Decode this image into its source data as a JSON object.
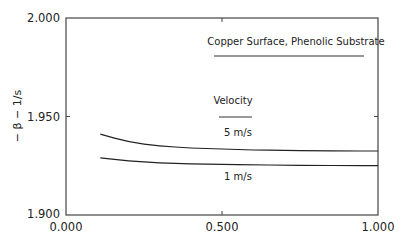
{
  "chart_data": {
    "type": "line",
    "title": "",
    "xlabel": "",
    "ylabel": "− β − 1/s",
    "xlim": [
      0.0,
      1.0
    ],
    "ylim": [
      1.9,
      2.0
    ],
    "xticks": [
      "0.000",
      "0.500",
      "1.000"
    ],
    "yticks": [
      "1.900",
      "1.950",
      "2.000"
    ],
    "grid": false,
    "legend_title": "Velocity",
    "annotations": [
      "Copper Surface, Phenolic Substrate"
    ],
    "series": [
      {
        "name": "5 m/s",
        "x": [
          0.11,
          0.2,
          0.3,
          0.4,
          0.5,
          0.6,
          0.7,
          0.8,
          0.9,
          1.0
        ],
        "y": [
          1.941,
          1.937,
          1.935,
          1.934,
          1.9335,
          1.933,
          1.9328,
          1.9326,
          1.9325,
          1.9325
        ]
      },
      {
        "name": "1 m/s",
        "x": [
          0.11,
          0.2,
          0.3,
          0.4,
          0.5,
          0.6,
          0.7,
          0.8,
          0.9,
          1.0
        ],
        "y": [
          1.929,
          1.9275,
          1.9265,
          1.926,
          1.9257,
          1.9255,
          1.9253,
          1.9252,
          1.9251,
          1.925
        ]
      }
    ]
  }
}
